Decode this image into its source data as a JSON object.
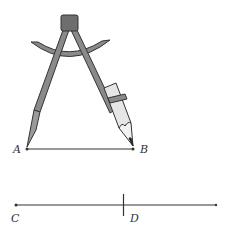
{
  "diagram": {
    "colors": {
      "stroke": "#333333",
      "compass_fill": "#8a8a8a",
      "head_fill": "#6e6e6e",
      "pencil_body": "#e6e6e6",
      "pencil_tip": "#222222"
    },
    "segment_ab": {
      "start_label": "A",
      "end_label": "B"
    },
    "ray_c": {
      "start_label": "C",
      "mark_label": "D"
    }
  }
}
